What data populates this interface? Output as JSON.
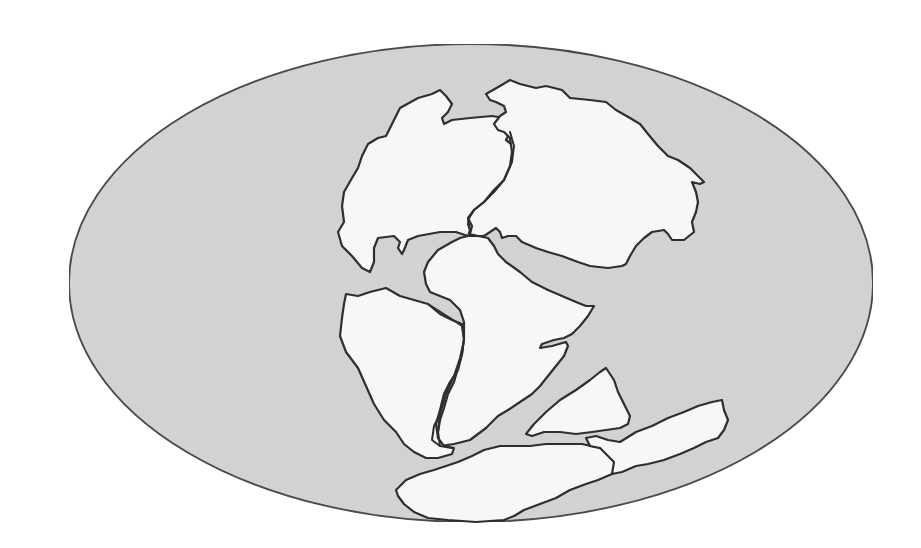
{
  "map": {
    "projection": "elliptical world projection",
    "subject": "supercontinent landmasses",
    "colors": {
      "background": "#ffffff",
      "ocean_fill": "#d4d4d4",
      "ocean_stroke": "#3a3a3a",
      "land_fill": "#f7f7f7",
      "land_stroke": "#2e2e2e"
    },
    "ocean": {
      "cx": 471,
      "cy": 283,
      "rx": 402,
      "ry": 239
    },
    "landmasses": [
      {
        "name": "north-america",
        "d": "M386,136 L400,108 L418,98 L432,94 L440,90 L446,96 L452,104 L448,112 L442,118 L444,124 L452,120 L470,118 L492,116 L504,118 L510,132 L506,140 L514,146 L512,162 L512,174 L504,186 L494,196 L482,206 L472,214 L468,224 L470,230 L468,236 L456,232 L440,232 L418,236 L408,240 L404,250 L402,254 L398,248 L400,242 L394,236 L378,238 L374,248 L374,262 L370,272 L362,268 L352,256 L342,246 L338,232 L344,222 L342,206 L344,192 L352,178 L358,168 L362,156 L368,144 L378,138 Z"
      },
      {
        "name": "eurasia",
        "d": "M486,94 L500,86 L510,80 L520,84 L536,88 L546,86 L562,90 L570,98 L590,100 L606,102 L616,110 L630,118 L640,124 L648,134 L658,146 L668,156 L678,160 L690,168 L698,176 L704,182 L700,184 L692,182 L696,192 L698,202 L696,212 L692,222 L694,232 L684,240 L672,240 L668,234 L664,230 L652,232 L644,238 L636,246 L630,256 L626,264 L622,266 L608,268 L590,266 L578,262 L562,256 L548,252 L536,248 L522,242 L516,236 L508,236 L502,238 L500,232 L496,228 L490,232 L484,236 L478,236 L470,234 L472,226 L468,218 L474,210 L484,202 L494,190 L504,180 L510,166 L512,152 L510,138 L504,132 L498,130 L494,124 L500,116 L506,112 L504,106 L496,102 L490,100 Z"
      },
      {
        "name": "africa",
        "d": "M468,236 L478,236 L488,238 L494,246 L498,254 L506,262 L520,272 L532,282 L548,290 L562,296 L576,302 L586,306 L594,306 L588,316 L580,326 L572,334 L564,338 L554,340 L542,344 L540,348 L552,346 L566,342 L568,346 L564,356 L556,366 L548,376 L540,386 L532,394 L520,402 L508,410 L498,416 L486,428 L470,440 L454,444 L440,446 L436,442 L438,432 L440,420 L444,408 L448,394 L454,382 L458,368 L462,354 L464,338 L464,322 L460,310 L450,300 L440,296 L430,292 L426,284 L424,272 L428,262 L438,250 L452,242 L460,238 Z"
      },
      {
        "name": "south-america",
        "d": "M346,294 L358,296 L370,292 L386,288 L400,296 L414,300 L428,304 L440,314 L452,320 L462,324 L464,338 L462,354 L458,370 L450,382 L444,394 L440,410 L436,424 L438,438 L444,446 L454,448 L452,454 L438,458 L426,458 L414,452 L404,444 L396,432 L384,420 L374,404 L366,386 L358,368 L346,352 L340,336 L342,318 L344,304 Z"
      },
      {
        "name": "india",
        "d": "M526,434 L534,424 L546,412 L560,400 L576,390 L590,380 L600,372 L606,368 L610,374 L614,380 L618,392 L624,404 L630,416 L628,424 L620,428 L606,430 L592,432 L576,434 L560,432 L544,432 L532,436 Z"
      },
      {
        "name": "antarctica",
        "d": "M396,490 L406,480 L420,474 L434,470 L446,466 L458,462 L472,456 L484,450 L500,446 L516,446 L530,446 L546,444 L562,444 L582,444 L600,448 L614,456 L618,466 L612,474 L598,480 L586,484 L570,490 L556,498 L540,504 L524,510 L514,516 L504,520 L476,522 L448,520 L428,518 L414,512 L404,504 L398,496 Z"
      },
      {
        "name": "australia",
        "d": "M586,438 L596,436 L608,440 L620,442 L636,432 L652,426 L668,418 L684,412 L698,406 L712,402 L722,400 L724,410 L728,420 L724,430 L718,438 L706,442 L694,448 L680,454 L664,460 L648,464 L636,466 L622,472 L612,474 L614,462 L608,456 L600,448 L590,446 Z"
      }
    ],
    "boundaries": [
      {
        "name": "north-america-eurasia-boundary",
        "d": "M510,132 L514,146 L512,162 L504,180 L494,192 L484,202 L474,210 L468,220 L470,230"
      },
      {
        "name": "africa-south-america-boundary",
        "d": "M428,304 L450,318 L462,326 L464,340 L460,358 L454,376 L446,394 L440,414 L438,432 L440,446"
      },
      {
        "name": "south-america-gulf-inlet",
        "d": "M440,414 L434,426 L432,440 L440,446 L452,448"
      }
    ]
  }
}
